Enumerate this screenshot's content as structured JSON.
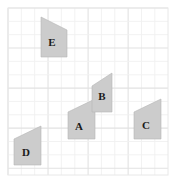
{
  "figure": {
    "background_color": "#ffffff",
    "grid": {
      "x": 8,
      "y": 8,
      "width": 160,
      "height": 167,
      "cell_size": 13.35,
      "columns": 12,
      "rows": 12.5,
      "minor_line_color": "#f0f0f0",
      "major_line_color": "#e2e2e2",
      "border_color": "#e8e8e8",
      "visible": true
    },
    "shape_style": {
      "fill_color": "#cccccc",
      "stroke_color": "#b5b5b5",
      "stroke_width": 0.6
    },
    "shapes": [
      {
        "id": "shape-a",
        "label": "A",
        "points": "68,112 95,99 95,139 68,139",
        "label_x": 79,
        "label_y": 127
      },
      {
        "id": "shape-b",
        "label": "B",
        "points": "92,86 112,73 112,112 92,112",
        "label_x": 102,
        "label_y": 97
      },
      {
        "id": "shape-c",
        "label": "C",
        "points": "134,112 161,99 161,139 134,139",
        "label_x": 146,
        "label_y": 126
      },
      {
        "id": "shape-d",
        "label": "D",
        "points": "14,139 41,126 41,165 14,165",
        "label_x": 26,
        "label_y": 153
      },
      {
        "id": "shape-e",
        "label": "E",
        "points": "41,17 67,30 67,57 41,57",
        "label_x": 52,
        "label_y": 43
      }
    ]
  }
}
